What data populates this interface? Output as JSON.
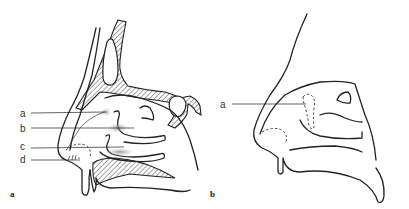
{
  "figure": {
    "panels": [
      {
        "id": "a",
        "panel_label": "a",
        "labels": [
          {
            "text": "a"
          },
          {
            "text": "b"
          },
          {
            "text": "c"
          },
          {
            "text": "d"
          }
        ]
      },
      {
        "id": "b",
        "panel_label": "b",
        "labels": [
          {
            "text": "a"
          }
        ]
      }
    ]
  }
}
